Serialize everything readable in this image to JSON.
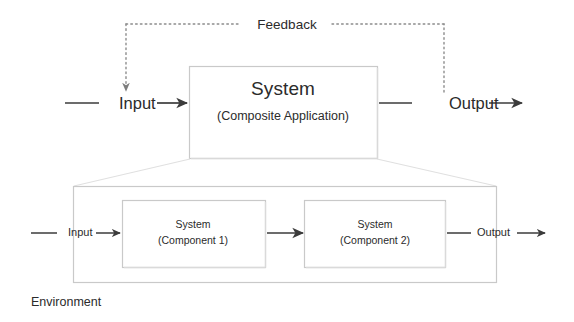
{
  "diagram": {
    "title_text": "Environment",
    "colors": {
      "stroke_dark": "#3b3b3b",
      "stroke_box": "#c9c9c9",
      "stroke_light": "#e2e2e2",
      "dotted": "#8c8c8c",
      "text": "#2b2b2b",
      "background": "#ffffff"
    },
    "feedback": {
      "label": "Feedback"
    },
    "top_level": {
      "input_label": "Input",
      "output_label": "Output",
      "system": {
        "title": "System",
        "subtitle": "(Composite Application)"
      }
    },
    "environment": {
      "label": "Environment",
      "input_label": "Input",
      "output_label": "Output",
      "components": [
        {
          "title": "System",
          "subtitle": "(Component 1)"
        },
        {
          "title": "System",
          "subtitle": "(Component 2)"
        }
      ]
    }
  }
}
